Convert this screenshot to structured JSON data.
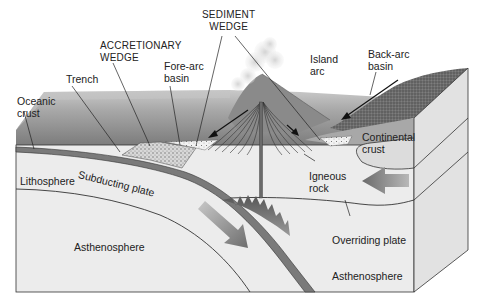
{
  "diagram": {
    "colors": {
      "sky": "#ffffff",
      "ocean_far": "#bdbdbd",
      "ocean_near": "#8e8e8e",
      "lithosphere": "#e6e6e6",
      "asthenosphere": "#ededed",
      "plate_band": "#7a7a7a",
      "arrow": "#8a8a8a",
      "line": "#2a2a2a"
    },
    "labels": {
      "sediment_wedge": "SEDIMENT\nWEDGE",
      "accretionary_wedge": "ACCRETIONARY\nWEDGE",
      "trench": "Trench",
      "fore_arc_basin": "Fore-arc\nbasin",
      "island_arc": "Island\narc",
      "back_arc_basin": "Back-arc\nbasin",
      "oceanic_crust": "Oceanic\ncrust",
      "continental_crust": "Continental\ncrust",
      "lithosphere": "Lithosphere",
      "subducting_plate": "Subducting plate",
      "igneous_rock": "Igneous\nrock",
      "overriding_plate": "Overriding plate",
      "asthenosphere_left": "Asthenosphere",
      "asthenosphere_right": "Asthenosphere"
    },
    "arrows": [
      {
        "name": "subduction-direction",
        "direction": "down-right"
      },
      {
        "name": "overriding-plate-direction",
        "direction": "left"
      }
    ]
  }
}
